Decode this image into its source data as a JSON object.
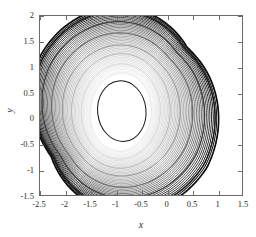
{
  "figure": {
    "background_color": "#ffffff",
    "axis_color": "#6b6b6b",
    "text_color": "#2b2b2b"
  },
  "chart_data": {
    "type": "line",
    "title": "",
    "subtitle": "",
    "xlabel": "x",
    "ylabel": "y",
    "xlim": [
      -2.5,
      1.5
    ],
    "ylim": [
      -1.5,
      2.0
    ],
    "xticks": [
      -2.5,
      -2,
      -1.5,
      -1,
      -0.5,
      0,
      0.5,
      1,
      1.5
    ],
    "xticklabels": [
      "-2.5",
      "-2",
      "-1.5",
      "-1",
      "-0.5",
      "0",
      "0.5",
      "1",
      "1.5"
    ],
    "yticks": [
      -1.5,
      -1,
      -0.5,
      0,
      0.5,
      1,
      1.5,
      2
    ],
    "yticklabels": [
      "-1.5",
      "-1",
      "-0.5",
      "0",
      "0.5",
      "1",
      "1.5",
      "2"
    ],
    "grid": false,
    "legend": null,
    "tick_direction": "in",
    "annotations": [],
    "series": [
      {
        "name": "trajectory",
        "color_range": [
          "#e8e8e8",
          "#101010"
        ],
        "loop_count": 46,
        "center": [
          -0.9,
          0.12
        ],
        "core_radii": [
          0.52,
          0.66
        ],
        "outer_radii": [
          1.62,
          1.76
        ],
        "cusp_point": [
          0.52,
          -0.74
        ],
        "extent": {
          "x_min": -2.5,
          "x_max": 1.33,
          "y_min": -1.42,
          "y_max": 1.99
        },
        "key_loops": [
          {
            "index": 1,
            "gray": "#e2e2e2",
            "rx": 0.54,
            "ry": 0.68,
            "y_top": 0.8,
            "y_bottom": -0.56,
            "x_left": -1.45,
            "x_right": -0.36
          },
          {
            "index": 6,
            "gray": "#cfcfcf",
            "rx": 0.7,
            "ry": 0.84,
            "y_top": 0.96,
            "y_bottom": -0.72,
            "x_left": -1.61,
            "x_right": -0.2
          },
          {
            "index": 12,
            "gray": "#b0b0b0",
            "rx": 0.88,
            "ry": 1.02,
            "y_top": 1.14,
            "y_bottom": -0.9,
            "x_left": -1.79,
            "x_right": -0.02
          },
          {
            "index": 18,
            "gray": "#8f8f8f",
            "rx": 1.06,
            "ry": 1.18,
            "y_top": 1.3,
            "y_bottom": -1.04,
            "x_left": -1.97,
            "x_right": 0.16
          },
          {
            "index": 26,
            "gray": "#6a6a6a",
            "rx": 1.26,
            "ry": 1.38,
            "y_top": 1.5,
            "y_bottom": -1.18,
            "x_left": -2.16,
            "x_right": 0.38
          },
          {
            "index": 34,
            "gray": "#3d3d3d",
            "rx": 1.44,
            "ry": 1.56,
            "y_top": 1.72,
            "y_bottom": -1.3,
            "x_left": -2.33,
            "x_right": 0.96
          },
          {
            "index": 42,
            "gray": "#1a1a1a",
            "rx": 1.58,
            "ry": 1.72,
            "y_top": 1.92,
            "y_bottom": -1.38,
            "x_left": -2.45,
            "x_right": 1.22
          },
          {
            "index": 46,
            "gray": "#0d0d0d",
            "rx": 1.62,
            "ry": 1.77,
            "y_top": 1.99,
            "y_bottom": -1.42,
            "x_left": -2.5,
            "x_right": 1.33
          }
        ]
      }
    ]
  }
}
